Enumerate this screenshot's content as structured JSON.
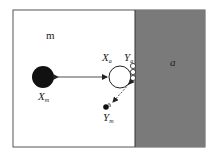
{
  "diagram": {
    "region_left_label": "m",
    "region_right_label": "a",
    "xm": {
      "main": "X",
      "sub": "m"
    },
    "xa": {
      "main": "X",
      "sub": "a"
    },
    "ya": {
      "main": "Y",
      "sub": "a"
    },
    "ym": {
      "main": "Y",
      "sub": "m"
    },
    "colors": {
      "region_right": "#7a7a7a",
      "border": "#555555",
      "particle_dark": "#111111"
    }
  }
}
